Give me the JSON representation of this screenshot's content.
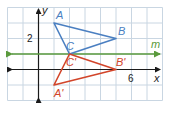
{
  "diagram": {
    "type": "coordinate-plane-reflection",
    "grid": {
      "x_min": -2,
      "x_max": 8,
      "y_min": -2,
      "y_max": 4,
      "unit_px": 15.5,
      "origin_px": [
        38.5,
        69.5
      ]
    },
    "axes": {
      "x_label": "x",
      "y_label": "y",
      "tick_labels": [
        {
          "axis": "y",
          "value": 2,
          "text": "2"
        },
        {
          "axis": "x",
          "value": 6,
          "text": "6"
        }
      ]
    },
    "line_m": {
      "label": "m",
      "y": 1,
      "color": "#5a9a3c"
    },
    "triangle_original": {
      "color": "#4a7fc1",
      "vertices": [
        {
          "label": "A",
          "x": 1,
          "y": 3
        },
        {
          "label": "B",
          "x": 5,
          "y": 2
        },
        {
          "label": "C",
          "x": 2,
          "y": 1
        }
      ]
    },
    "triangle_image": {
      "color": "#d2452a",
      "vertices": [
        {
          "label": "A'",
          "x": 1,
          "y": -1
        },
        {
          "label": "B'",
          "x": 5,
          "y": 0
        },
        {
          "label": "C'",
          "x": 2,
          "y": 1
        }
      ]
    },
    "colors": {
      "grid": "#c9d6e2",
      "axis": "#1a1a1a",
      "border": "#b9c8d6"
    }
  }
}
